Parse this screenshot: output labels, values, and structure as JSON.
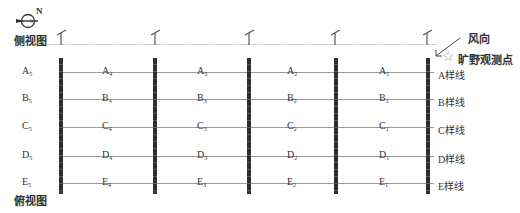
{
  "compass": {
    "north_label": "N"
  },
  "side_view": {
    "label": "侧视图"
  },
  "top_view": {
    "label": "俯视图"
  },
  "legend": {
    "wind_label": "风向",
    "station_label": "旷野观测点",
    "station_icon": "☆"
  },
  "rows": [
    {
      "letter": "A",
      "line_label": "A样线",
      "cells": [
        {
          "l": "A",
          "s": "5"
        },
        {
          "l": "A",
          "s": "4"
        },
        {
          "l": "A",
          "s": "3"
        },
        {
          "l": "A",
          "s": "2"
        },
        {
          "l": "A",
          "s": "1"
        }
      ]
    },
    {
      "letter": "B",
      "line_label": "B样线",
      "cells": [
        {
          "l": "B",
          "s": "5"
        },
        {
          "l": "B",
          "s": "4"
        },
        {
          "l": "B",
          "s": "3"
        },
        {
          "l": "B",
          "s": "2"
        },
        {
          "l": "B",
          "s": "1"
        }
      ]
    },
    {
      "letter": "C",
      "line_label": "C样线",
      "cells": [
        {
          "l": "C",
          "s": "5"
        },
        {
          "l": "C",
          "s": "4"
        },
        {
          "l": "C",
          "s": "3"
        },
        {
          "l": "C",
          "s": "2"
        },
        {
          "l": "C",
          "s": "1"
        }
      ]
    },
    {
      "letter": "D",
      "line_label": "D样线",
      "cells": [
        {
          "l": "D",
          "s": "5"
        },
        {
          "l": "D",
          "s": "4"
        },
        {
          "l": "D",
          "s": "3"
        },
        {
          "l": "D",
          "s": "2"
        },
        {
          "l": "D",
          "s": "1"
        }
      ]
    },
    {
      "letter": "E",
      "line_label": "E样线",
      "cells": [
        {
          "l": "E",
          "s": "5"
        },
        {
          "l": "E",
          "s": "4"
        },
        {
          "l": "E",
          "s": "3"
        },
        {
          "l": "E",
          "s": "2"
        },
        {
          "l": "E",
          "s": "1"
        }
      ]
    }
  ],
  "colors": {
    "shelterbelt": "#2e2e2e",
    "transect_line": "#9a9a9a",
    "text": "#333333"
  }
}
